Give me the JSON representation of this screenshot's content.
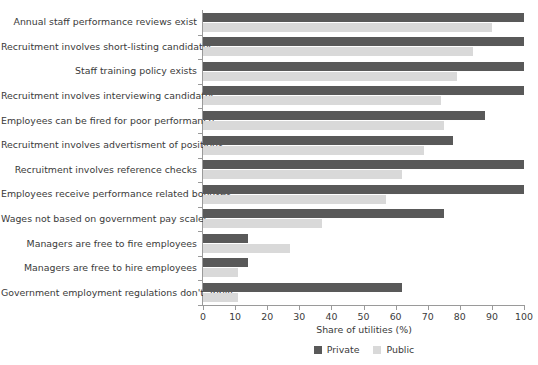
{
  "chart_data": {
    "type": "bar",
    "orientation": "horizontal",
    "title": "",
    "xlabel": "Share of utilities (%)",
    "ylabel": "",
    "xlim": [
      0,
      100
    ],
    "xticks": [
      0,
      10,
      20,
      30,
      40,
      50,
      60,
      70,
      80,
      90,
      100
    ],
    "xtick_labels": [
      "0",
      "10",
      "20",
      "30",
      "40",
      "50",
      "60",
      "70",
      "80",
      "90",
      "100"
    ],
    "grid": false,
    "legend_position": "bottom-center",
    "categories": [
      "Annual staff performance reviews exist",
      "Recruitment involves short-listing candidates",
      "Staff training policy exists",
      "Recruitment involves interviewing candidates",
      "Employees can be fired for poor performance",
      "Recruitment involves advertisment of positions",
      "Recruitment involves reference checks",
      "Employees receive performance related bonuses",
      "Wages not based on government pay scales",
      "Managers are free to fire employees",
      "Managers are free to hire employees",
      "Government employment regulations don't apply"
    ],
    "series": [
      {
        "name": "Private",
        "color": "#595959",
        "values": [
          100,
          100,
          100,
          100,
          88,
          78,
          100,
          100,
          75,
          14,
          14,
          62
        ]
      },
      {
        "name": "Public",
        "color": "#d9d9d9",
        "values": [
          90,
          84,
          79,
          74,
          75,
          69,
          62,
          57,
          37,
          27,
          11,
          11
        ]
      }
    ]
  },
  "legend": {
    "items": [
      {
        "label": "Private",
        "color": "#595959"
      },
      {
        "label": "Public",
        "color": "#d9d9d9"
      }
    ]
  }
}
